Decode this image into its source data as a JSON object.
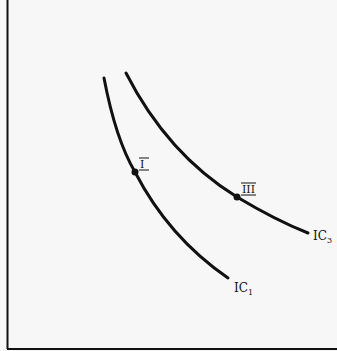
{
  "diagram": {
    "type": "indifference-curves",
    "colors": {
      "background": "#f7f7f7",
      "ink": "#111111"
    },
    "axes": {
      "x_axis_label": "",
      "y_axis_label": ""
    },
    "curves": [
      {
        "id": "IC1",
        "label_main": "IC",
        "label_sub": "1"
      },
      {
        "id": "IC3",
        "label_main": "IC",
        "label_sub": "3"
      }
    ],
    "points": [
      {
        "id": "I",
        "label": "I",
        "on_curve": "IC1"
      },
      {
        "id": "III",
        "label": "III",
        "on_curve": "IC3"
      }
    ]
  }
}
